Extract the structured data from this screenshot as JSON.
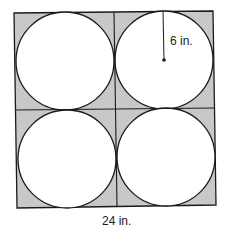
{
  "diagram": {
    "labels": {
      "radius": "6 in.",
      "side": "24 in."
    },
    "colors": {
      "shade": "#c8c8c8",
      "stroke": "#1a1a1a",
      "circle_fill": "#ffffff",
      "background": "#ffffff"
    },
    "shapes": {
      "square_side_in": 24,
      "circle_count": 4,
      "circle_radius_in": 6,
      "grid": "2x2"
    }
  }
}
